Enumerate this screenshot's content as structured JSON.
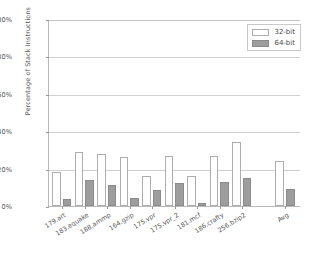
{
  "chart_data": {
    "type": "bar",
    "title": "",
    "xlabel": "",
    "ylabel": "Percentage of Stack Instructions",
    "ylim": [
      0,
      100
    ],
    "yticks": [
      "0%",
      "20%",
      "40%",
      "60%",
      "80%",
      "100%"
    ],
    "ytick_values": [
      0,
      20,
      40,
      60,
      80,
      100
    ],
    "grid": true,
    "legend_position": "top-right",
    "categories": [
      "179.art",
      "183.equake",
      "188.ammp",
      "164.gzip",
      "175.vpr",
      "175.vpr_2",
      "181.mcf",
      "186.crafty",
      "256.bzip2",
      "Avg"
    ],
    "series": [
      {
        "name": "32-bit",
        "color": "#ffffff",
        "edge_color": "#adadad",
        "values": [
          18,
          29,
          28,
          26,
          16,
          27,
          16,
          27,
          34,
          24
        ]
      },
      {
        "name": "64-bit",
        "color": "#9d9d9d",
        "edge_color": "#8b8b8b",
        "values": [
          4,
          14,
          11.5,
          4.5,
          8.5,
          12.5,
          1.5,
          13,
          15,
          9
        ]
      }
    ]
  },
  "legend": {
    "items": [
      {
        "label": "32-bit"
      },
      {
        "label": "64-bit"
      }
    ]
  },
  "colors": {
    "background": "#ffffff",
    "axis": "#b9b9b9",
    "grid": "#d0d0d0",
    "text": "#555555",
    "bar_32bit": "#ffffff",
    "bar_64bit": "#9d9d9d"
  }
}
